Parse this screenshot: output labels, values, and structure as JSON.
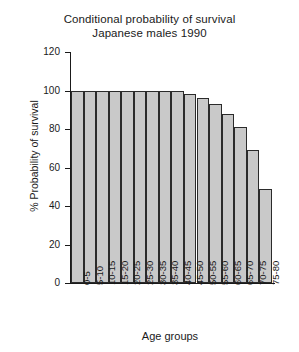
{
  "chart_data": {
    "type": "bar",
    "title": "Conditional probability of survival",
    "subtitle": "Japanese males 1990",
    "title_lines": [
      "Conditional probability of survival",
      "Japanese males 1990"
    ],
    "xlabel": "Age groups",
    "ylabel": "% Probability of survival",
    "categories": [
      "0-5",
      "5-10",
      "10-15",
      "15-20",
      "20-25",
      "25-30",
      "30-35",
      "35-40",
      "40-45",
      "45-50",
      "50-55",
      "55-60",
      "60-65",
      "65-70",
      "70-75",
      "75-80"
    ],
    "values": [
      100,
      100,
      100,
      100,
      100,
      100,
      100,
      100,
      100,
      98,
      96,
      93,
      88,
      81,
      69,
      49
    ],
    "ylim": [
      0,
      120
    ],
    "yticks": [
      0,
      20,
      40,
      60,
      80,
      100,
      120
    ],
    "ytick_labels": [
      "0",
      "20",
      "40",
      "60",
      "80",
      "100",
      "120"
    ],
    "grid": false,
    "legend": "none",
    "bar_fill_color": "#c9c9c9",
    "bar_edge_color": "#2b2b2b",
    "background_color": "#ffffff",
    "axis_color": "#1a1a1a"
  }
}
